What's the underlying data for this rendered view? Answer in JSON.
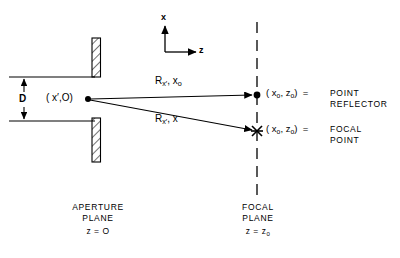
{
  "figure": {
    "axes": {
      "x_label": "x",
      "z_label": "z"
    },
    "aperture": {
      "dimension_label": "D",
      "source_point_label": "( x′,O)",
      "caption_line1": "APERTURE",
      "caption_line2": "PLANE",
      "caption_line3": "z = O"
    },
    "rays": {
      "upper_label_main": "R",
      "upper_label_sub1": "x′",
      "upper_label_rest": ", x",
      "upper_label_sub2": "o",
      "lower_label_main": "R",
      "lower_label_sub1": "x′",
      "lower_label_rest": ", x",
      "lower_label_sub2": ""
    },
    "focal_plane": {
      "caption_line1": "FOCAL",
      "caption_line2": "PLANE",
      "caption_line3": "z = z",
      "caption_line3_sub": "0"
    },
    "point_reflector": {
      "coord_open": "( x",
      "coord_sub1": "o",
      "coord_mid": ", z",
      "coord_sub2": "o",
      "coord_close": ")  =",
      "name_line1": "POINT",
      "name_line2": "REFLECTOR"
    },
    "focal_point": {
      "coord_open": "( x",
      "coord_sub1": "o",
      "coord_mid": ", z",
      "coord_sub2": "o",
      "coord_close": ")  =",
      "name_line1": "FOCAL",
      "name_line2": "POINT"
    },
    "colors": {
      "ink": "#000000",
      "background": "#ffffff"
    }
  }
}
